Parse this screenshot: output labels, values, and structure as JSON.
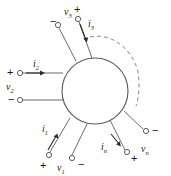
{
  "figure": {
    "network_shape": "circle",
    "colors": {
      "background": "#ffffff",
      "stroke": "#4a4a4a",
      "text": "#1a1a1a",
      "dashed_arc": "#8a8a8a"
    },
    "ports": [
      {
        "id": "port-1",
        "current_label": "i",
        "current_sub": "1",
        "voltage_label": "v",
        "voltage_sub": "1",
        "plus_sign": "+",
        "minus_sign": "−"
      },
      {
        "id": "port-2",
        "current_label": "i",
        "current_sub": "2",
        "voltage_label": "v",
        "voltage_sub": "2",
        "plus_sign": "+",
        "minus_sign": "−"
      },
      {
        "id": "port-3",
        "current_label": "i",
        "current_sub": "3",
        "voltage_label": "v",
        "voltage_sub": "3",
        "plus_sign": "+",
        "minus_sign": "−"
      },
      {
        "id": "port-n",
        "current_label": "i",
        "current_sub": "n",
        "voltage_label": "v",
        "voltage_sub": "n",
        "plus_sign": "+",
        "minus_sign": "−"
      }
    ],
    "ellipsis_arc": "dashed"
  }
}
